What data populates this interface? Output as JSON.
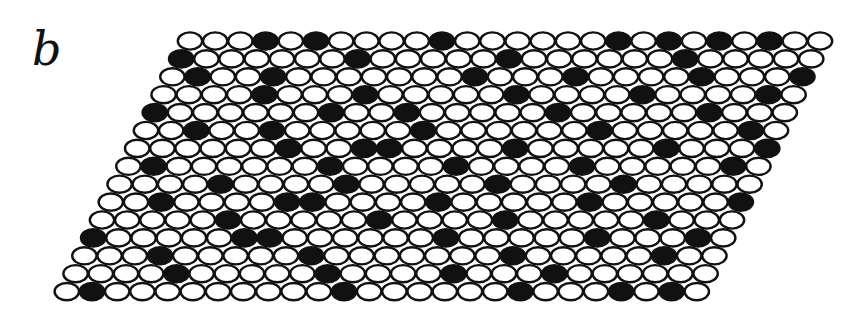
{
  "panel": {
    "label": "b"
  },
  "lattice": {
    "rows": 15,
    "cols": 26,
    "row0_x": 190,
    "row0_y": 41,
    "dx": 25.2,
    "dy": 17.9,
    "row_shift": -8.8,
    "rx": 12.2,
    "ry": 8.6,
    "colors": {
      "stroke": "#111111",
      "empty": "#ffffff",
      "filled": "#111111"
    },
    "filled": [
      [
        3,
        5,
        10,
        17,
        19,
        21,
        23
      ],
      [
        0,
        7,
        13,
        20
      ],
      [
        1,
        4,
        12,
        16,
        21,
        25
      ],
      [
        4,
        8,
        14,
        19,
        24
      ],
      [
        0,
        7,
        10,
        16,
        22
      ],
      [
        2,
        5,
        11,
        18,
        24
      ],
      [
        6,
        9,
        10,
        15,
        21,
        25
      ],
      [
        1,
        8,
        13,
        18,
        24
      ],
      [
        4,
        9,
        15,
        20
      ],
      [
        2,
        7,
        8,
        13,
        19,
        25
      ],
      [
        5,
        11,
        16,
        22
      ],
      [
        0,
        6,
        7,
        14,
        20,
        24
      ],
      [
        3,
        9,
        17,
        23
      ],
      [
        4,
        10,
        15,
        19
      ],
      [
        1,
        11,
        18,
        22,
        24
      ]
    ]
  }
}
